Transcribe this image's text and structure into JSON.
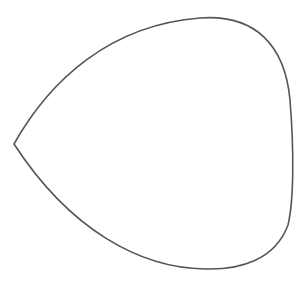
{
  "figure": {
    "stroke_color": "#555555",
    "background": "#ffffff",
    "stroke_width": 1.6
  }
}
